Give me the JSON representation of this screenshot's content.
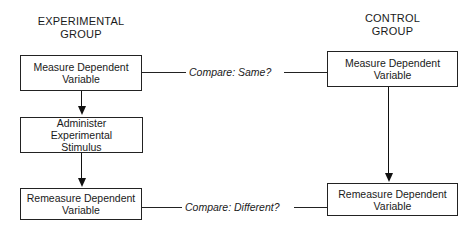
{
  "diagram": {
    "experimental_group": {
      "header_line1": "EXPERIMENTAL",
      "header_line2": "GROUP",
      "steps": [
        {
          "line1": "Measure Dependent",
          "line2": "Variable"
        },
        {
          "line1": "Administer Experimental",
          "line2": "Stimulus"
        },
        {
          "line1": "Remeasure Dependent",
          "line2": "Variable"
        }
      ]
    },
    "control_group": {
      "header_line1": "CONTROL",
      "header_line2": "GROUP",
      "steps": [
        {
          "line1": "Measure Dependent",
          "line2": "Variable"
        },
        {
          "line1": "Remeasure Dependent",
          "line2": "Variable"
        }
      ]
    },
    "comparisons": [
      {
        "label": "Compare: Same?"
      },
      {
        "label": "Compare: Different?"
      }
    ]
  }
}
